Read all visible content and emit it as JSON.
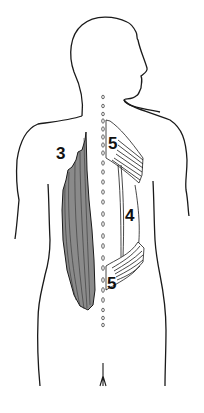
{
  "figure": {
    "colors": {
      "outline": "#1a1a1a",
      "muscle_fill_dark": "#8a8a8a",
      "muscle_fill_light": "#ffffff",
      "background": "#ffffff"
    },
    "labels": [
      {
        "id": "label-3",
        "text": "3",
        "x": 56,
        "y": 159
      },
      {
        "id": "label-5-upper",
        "text": "5",
        "x": 108,
        "y": 149
      },
      {
        "id": "label-4",
        "text": "4",
        "x": 125,
        "y": 221
      },
      {
        "id": "label-5-lower",
        "text": "5",
        "x": 107,
        "y": 289
      }
    ]
  }
}
